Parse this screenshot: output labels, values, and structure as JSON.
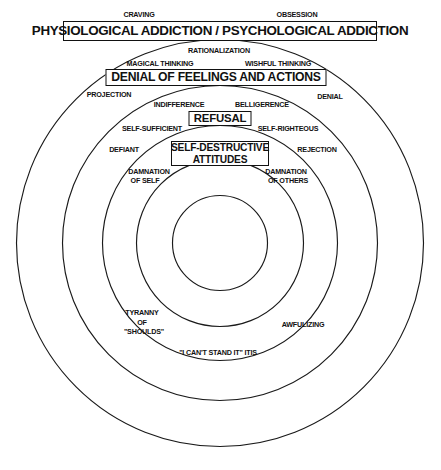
{
  "diagram": {
    "background": "#ffffff",
    "stroke_color": "#1a1a1a",
    "geometry": {
      "center_x": 220,
      "center_y": 243,
      "radii": [
        203.5,
        157.5,
        117.5,
        83.5,
        47.5
      ]
    },
    "banners": [
      {
        "id": "addiction",
        "text": "PHYSIOLOGICAL ADDICTION / PSYCHOLOGICAL ADDICTION"
      },
      {
        "id": "denial",
        "text": "DENIAL OF FEELINGS AND ACTIONS"
      },
      {
        "id": "refusal",
        "text": "REFUSAL"
      },
      {
        "id": "self_destructive_attitudes",
        "line1": "SELF-DESTRUCTIVE",
        "line2": "ATTITUDES"
      }
    ],
    "labels": {
      "craving": "CRAVING",
      "obsession": "OBSESSION",
      "rationalization": "RATIONALIZATION",
      "magical_thinking": "MAGICAL THINKING",
      "wishful_thinking": "WISHFUL THINKING",
      "projection": "PROJECTION",
      "denial": "DENIAL",
      "indifference": "INDIFFERENCE",
      "belligerence": "BELLIGERENCE",
      "self_sufficient": "SELF-SUFFICIENT",
      "self_righteous": "SELF-RIGHTEOUS",
      "defiant": "DEFIANT",
      "rejection": "REJECTION",
      "damnation_of_self_l1": "DAMNATION",
      "damnation_of_self_l2": "OF SELF",
      "damnation_of_others_l1": "DAMNATION",
      "damnation_of_others_l2": "OF OTHERS",
      "tyranny_l1": "TYRANNY",
      "tyranny_l2": "OF",
      "tyranny_l3": "\"SHOULDS\"",
      "awfulizing": "AWFULIZING",
      "cant_stand_it": "\"I CAN'T STAND IT\" ITIS"
    }
  }
}
